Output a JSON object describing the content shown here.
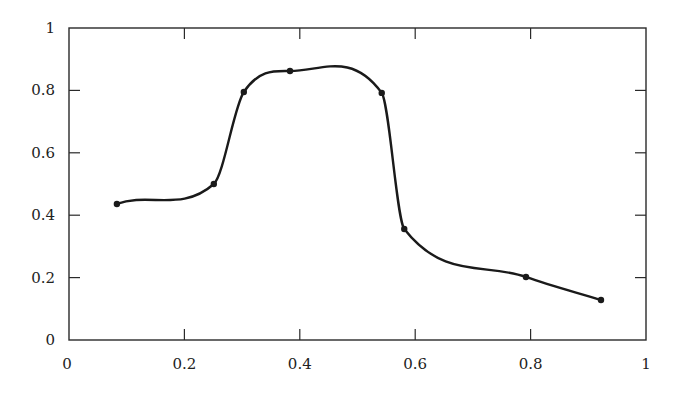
{
  "chart_data": {
    "type": "line",
    "title": "",
    "xlabel": "",
    "ylabel": "",
    "xlim": [
      0,
      1
    ],
    "ylim": [
      0,
      1
    ],
    "grid": false,
    "legend": null,
    "x_ticks": [
      0,
      0.2,
      0.4,
      0.6,
      0.8,
      1
    ],
    "x_tick_labels": [
      "0",
      "0.2",
      "0.4",
      "0.6",
      "0.8",
      "1"
    ],
    "y_ticks": [
      0,
      0.2,
      0.4,
      0.6,
      0.8,
      1
    ],
    "y_tick_labels": [
      "0",
      "0.2",
      "0.4",
      "0.6",
      "0.8",
      "1"
    ],
    "series": [
      {
        "name": "curve",
        "style": "smooth line with point markers",
        "color": "#1a1a1a",
        "x": [
          0.083,
          0.251,
          0.303,
          0.383,
          0.542,
          0.581,
          0.792,
          0.922
        ],
        "y": [
          0.436,
          0.5,
          0.795,
          0.862,
          0.792,
          0.356,
          0.202,
          0.128
        ]
      }
    ]
  },
  "colors": {
    "axis": "#2a2a2a",
    "line": "#1a1a1a",
    "background": "#ffffff"
  }
}
